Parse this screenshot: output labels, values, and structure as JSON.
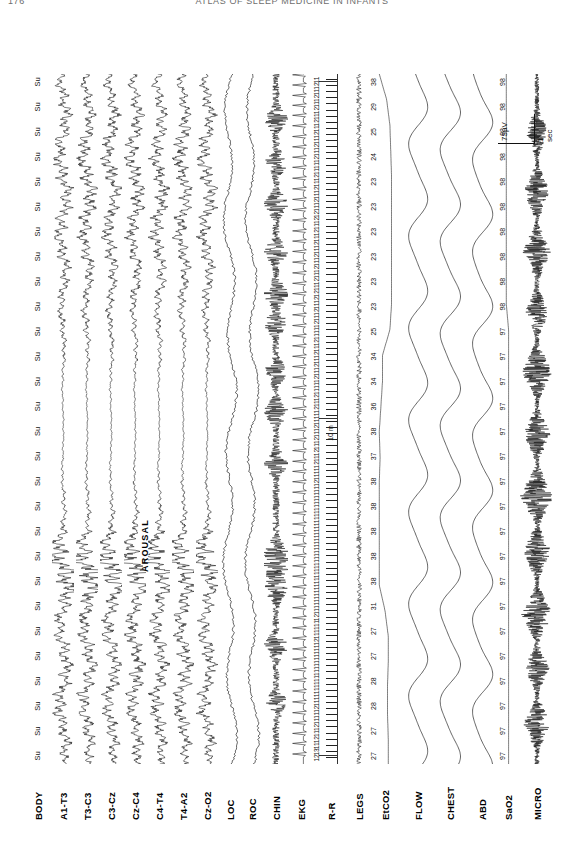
{
  "page": {
    "number": "176",
    "running_head": "ATLAS OF SLEEP MEDICINE IN INFANTS"
  },
  "annotations": {
    "arousal": "AROUSAL",
    "rr_minute_mark": "10 m"
  },
  "calibration": {
    "amplitude": "75µV",
    "time": "1 sec"
  },
  "channels": [
    {
      "label": "BODY",
      "type": "text-markers"
    },
    {
      "label": "A1-T3",
      "type": "eeg"
    },
    {
      "label": "T3-C3",
      "type": "eeg"
    },
    {
      "label": "C3-Cz",
      "type": "eeg"
    },
    {
      "label": "Cz-C4",
      "type": "eeg"
    },
    {
      "label": "C4-T4",
      "type": "eeg"
    },
    {
      "label": "T4-A2",
      "type": "eeg"
    },
    {
      "label": "Cz-O2",
      "type": "eeg"
    },
    {
      "label": "LOC",
      "type": "eog"
    },
    {
      "label": "ROC",
      "type": "eog"
    },
    {
      "label": "CHIN",
      "type": "emg"
    },
    {
      "label": "EKG",
      "type": "ekg"
    },
    {
      "label": "R-R",
      "type": "rr-interval"
    },
    {
      "label": "LEGS",
      "type": "emg-flat"
    },
    {
      "label": "EtCO2",
      "type": "capnography"
    },
    {
      "label": "FLOW",
      "type": "airflow"
    },
    {
      "label": "CHEST",
      "type": "effort"
    },
    {
      "label": "ABD",
      "type": "effort"
    },
    {
      "label": "SaO2",
      "type": "oximetry"
    },
    {
      "label": "MICRO",
      "type": "sound"
    }
  ],
  "chart_data": {
    "type": "line",
    "xlabel": "time",
    "ylabel": "",
    "grid": false,
    "legend": "none",
    "body_position_markers": [
      "Su",
      "Su",
      "Su",
      "Su",
      "Su",
      "Su",
      "Su",
      "Su",
      "Su",
      "Su",
      "Su",
      "Su",
      "Su",
      "Su",
      "Su",
      "Su",
      "Su",
      "Su",
      "Su",
      "Su",
      "Su",
      "Su",
      "Su",
      "Su",
      "Su",
      "Su",
      "Su",
      "Su"
    ],
    "series": [
      {
        "name": "EtCO2",
        "unit": "mmHg",
        "values": [
          27,
          27,
          28,
          28,
          27,
          27,
          31,
          38,
          38,
          38,
          38,
          38,
          37,
          38,
          36,
          34,
          34,
          25,
          23,
          23,
          23,
          23,
          23,
          23,
          24,
          25,
          29,
          38
        ]
      },
      {
        "name": "SaO2",
        "unit": "%",
        "values": [
          97,
          97,
          97,
          97,
          97,
          97,
          97,
          97,
          97,
          97,
          97,
          97,
          97,
          97,
          97,
          97,
          97,
          97,
          98,
          98,
          98,
          98,
          98,
          98,
          98,
          98,
          98,
          98
        ]
      },
      {
        "name": "R-R",
        "unit": "beats",
        "values": [
          12,
          13,
          11,
          12,
          11,
          12,
          11,
          11,
          12,
          11,
          11,
          11,
          11,
          11,
          11,
          11,
          11,
          11,
          11,
          12,
          11,
          11,
          11,
          12,
          11,
          11,
          11,
          11,
          11,
          11,
          11,
          11,
          11,
          11,
          11,
          11,
          11,
          11,
          11,
          11,
          11,
          11,
          11,
          11,
          11,
          12,
          11,
          11,
          12,
          11,
          12,
          11,
          12,
          11,
          12,
          11,
          11,
          12,
          11,
          12,
          11,
          11,
          12,
          11,
          12,
          11,
          12,
          11,
          12,
          11,
          11,
          12,
          11,
          12,
          11,
          12,
          12,
          11,
          12,
          11,
          12,
          11,
          12,
          11,
          12,
          11,
          12,
          11,
          12,
          12,
          11,
          12,
          11,
          12,
          11,
          12,
          11,
          11,
          12,
          11,
          12,
          11,
          12,
          11,
          12,
          11,
          12,
          11,
          12,
          11,
          12,
          11
        ]
      }
    ]
  }
}
